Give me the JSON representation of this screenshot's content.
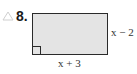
{
  "problem": {
    "number": "8.",
    "marker_icon": "triangle-outline-icon"
  },
  "figure": {
    "shape": "rectangle",
    "fill_color": "#e4e4e4",
    "stroke_color": "#2a2a2a",
    "right_angle_marker": "bottom-left",
    "labels": {
      "right_side": "x − 2",
      "bottom_side": "x + 3"
    }
  }
}
